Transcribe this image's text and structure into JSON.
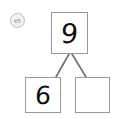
{
  "page": {
    "background_color": "#ffffff",
    "width": 127,
    "height": 119
  },
  "watermark": {
    "name": "circular-stamp-badge",
    "label": "k5",
    "border_color": "#b9b9b9",
    "fill_color": "#f2f2f2",
    "text_color": "#7a7a7a"
  },
  "number_bond": {
    "box_border_color": "#9a9a9a",
    "box_fill_color": "#ffffff",
    "digit_color": "#0d0d0d",
    "connector_color": "#6e6e6e",
    "whole": {
      "value": "9",
      "position": "top"
    },
    "parts": [
      {
        "value": "6",
        "position": "bottom-left",
        "filled": true
      },
      {
        "value": "",
        "position": "bottom-right",
        "filled": false
      }
    ],
    "connectors": [
      {
        "name": "connector-left",
        "from": [
          69,
          54
        ],
        "to": [
          56,
          77
        ]
      },
      {
        "name": "connector-right",
        "from": [
          72,
          54
        ],
        "to": [
          86,
          77
        ]
      }
    ]
  }
}
